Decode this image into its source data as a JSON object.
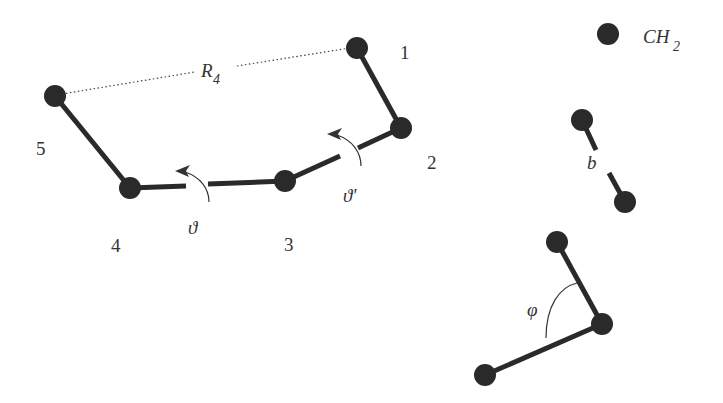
{
  "diagram": {
    "colors": {
      "atom": "#2a2a2a",
      "bond": "#2a2a2a",
      "text": "#333333",
      "background": "#ffffff"
    },
    "chain": {
      "atoms": [
        {
          "id": "1",
          "label": "1",
          "x": 357,
          "y": 48
        },
        {
          "id": "2",
          "label": "2",
          "x": 401,
          "y": 128
        },
        {
          "id": "3",
          "label": "3",
          "x": 285,
          "y": 181
        },
        {
          "id": "4",
          "label": "4",
          "x": 130,
          "y": 188
        },
        {
          "id": "5",
          "label": "5",
          "x": 55,
          "y": 96
        }
      ],
      "end_to_end_label": "R",
      "end_to_end_subscript": "4",
      "torsion_labels": {
        "theta": "ϑ",
        "theta_prime": "ϑ'"
      }
    },
    "legend": {
      "atom_label": "CH",
      "atom_subscript": "2",
      "bond_length_label": "b",
      "bond_angle_label": "φ"
    }
  }
}
